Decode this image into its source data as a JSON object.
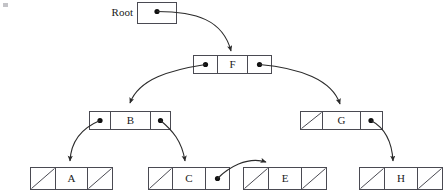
{
  "diagram": {
    "root_label": "Root",
    "colors": {
      "box_stroke": "#4a4a52",
      "box_fill": "#ffffff",
      "pointer_dot": "#111111",
      "link_curve": "#2b2b2b",
      "text": "#1a1a1a",
      "background": "#ffffff"
    },
    "root_pointer": {
      "name": "root-pointer-box",
      "has_dot": true,
      "target": "F"
    },
    "nodes": [
      {
        "id": "F",
        "label": "F",
        "left": {
          "type": "pointer",
          "target": "B"
        },
        "right": {
          "type": "pointer",
          "target": "G"
        },
        "level": 1
      },
      {
        "id": "B",
        "label": "B",
        "left": {
          "type": "pointer",
          "target": "A"
        },
        "right": {
          "type": "pointer",
          "target": "C"
        },
        "level": 2
      },
      {
        "id": "G",
        "label": "G",
        "left": {
          "type": "null"
        },
        "right": {
          "type": "pointer",
          "target": "H"
        },
        "level": 2
      },
      {
        "id": "A",
        "label": "A",
        "left": {
          "type": "null"
        },
        "right": {
          "type": "null"
        },
        "level": 3
      },
      {
        "id": "C",
        "label": "C",
        "left": {
          "type": "null"
        },
        "right": {
          "type": "pointer",
          "target": "E"
        },
        "level": 3
      },
      {
        "id": "E",
        "label": "E",
        "left": {
          "type": "null"
        },
        "right": {
          "type": "null"
        },
        "level": 3
      },
      {
        "id": "H",
        "label": "H",
        "left": {
          "type": "null"
        },
        "right": {
          "type": "null"
        },
        "level": 3
      }
    ],
    "edges": [
      {
        "from": "Root",
        "to": "F"
      },
      {
        "from": "F",
        "to": "B"
      },
      {
        "from": "F",
        "to": "G"
      },
      {
        "from": "B",
        "to": "A"
      },
      {
        "from": "B",
        "to": "C"
      },
      {
        "from": "C",
        "to": "E"
      },
      {
        "from": "G",
        "to": "H"
      }
    ],
    "labels": {
      "root": "Root",
      "f": "F",
      "b": "B",
      "g": "G",
      "a": "A",
      "c": "C",
      "e": "E",
      "h": "H"
    }
  }
}
